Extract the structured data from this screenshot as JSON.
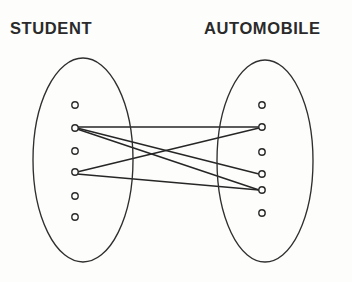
{
  "diagram": {
    "type": "set-membership-mapping",
    "background_color": "#fdfdfc",
    "stroke_color": "#2b2b2b",
    "label_color": "#2a2a2a",
    "left_set": {
      "label": "STUDENT",
      "ellipse": {
        "cx": 83,
        "cy": 160,
        "rx": 50,
        "ry": 102
      },
      "member_count": 6,
      "members": [
        {
          "id": "s1",
          "x": 75,
          "y": 105
        },
        {
          "id": "s2",
          "x": 75,
          "y": 128
        },
        {
          "id": "s3",
          "x": 75,
          "y": 151
        },
        {
          "id": "s4",
          "x": 75,
          "y": 172
        },
        {
          "id": "s5",
          "x": 75,
          "y": 196
        },
        {
          "id": "s6",
          "x": 75,
          "y": 217
        }
      ]
    },
    "right_set": {
      "label": "AUTOMOBILE",
      "ellipse": {
        "cx": 265,
        "cy": 161,
        "rx": 48,
        "ry": 101
      },
      "member_count": 6,
      "members": [
        {
          "id": "a1",
          "x": 262,
          "y": 105
        },
        {
          "id": "a2",
          "x": 262,
          "y": 127
        },
        {
          "id": "a3",
          "x": 262,
          "y": 152
        },
        {
          "id": "a4",
          "x": 262,
          "y": 174
        },
        {
          "id": "a5",
          "x": 262,
          "y": 190
        },
        {
          "id": "a6",
          "x": 262,
          "y": 213
        }
      ]
    },
    "edges": [
      {
        "id": "e1",
        "from": "s2",
        "to": "a2",
        "x1": 77,
        "y1": 127,
        "x2": 259,
        "y2": 127
      },
      {
        "id": "e2",
        "from": "s2",
        "to": "a4",
        "x1": 77,
        "y1": 128,
        "x2": 259,
        "y2": 174
      },
      {
        "id": "e3",
        "from": "s2",
        "to": "a5",
        "x1": 77,
        "y1": 129,
        "x2": 259,
        "y2": 190
      },
      {
        "id": "e4",
        "from": "s4",
        "to": "a2",
        "x1": 77,
        "y1": 172,
        "x2": 259,
        "y2": 128
      },
      {
        "id": "e5",
        "from": "s4",
        "to": "a5",
        "x1": 77,
        "y1": 174,
        "x2": 259,
        "y2": 190
      }
    ],
    "dot_radius": 3.2
  }
}
